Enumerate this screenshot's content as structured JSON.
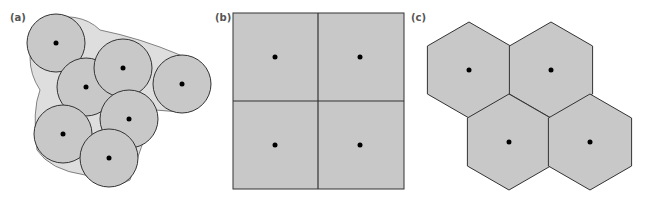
{
  "panels": [
    {
      "id": "a",
      "label": "(a)",
      "label_pos": [
        10,
        21
      ],
      "shape": "circle",
      "radius": 29,
      "cells": [
        {
          "cx": 56,
          "cy": 43
        },
        {
          "cx": 86,
          "cy": 87
        },
        {
          "cx": 123,
          "cy": 68
        },
        {
          "cx": 182,
          "cy": 84
        },
        {
          "cx": 129,
          "cy": 119
        },
        {
          "cx": 63,
          "cy": 134
        },
        {
          "cx": 109,
          "cy": 158
        }
      ]
    },
    {
      "id": "b",
      "label": "(b)",
      "label_pos": [
        215,
        21
      ],
      "shape": "square",
      "bounds": {
        "x": 233,
        "y": 13,
        "w": 171,
        "h": 176
      },
      "divider": {
        "x": 318,
        "y": 101
      },
      "dots": [
        {
          "cx": 275,
          "cy": 57
        },
        {
          "cx": 360,
          "cy": 57
        },
        {
          "cx": 275,
          "cy": 145
        },
        {
          "cx": 360,
          "cy": 145
        }
      ]
    },
    {
      "id": "c",
      "label": "(c)",
      "label_pos": [
        411,
        21
      ],
      "shape": "hexagon",
      "radius": 48,
      "cells": [
        {
          "cx": 469,
          "cy": 70
        },
        {
          "cx": 551,
          "cy": 70
        },
        {
          "cx": 509,
          "cy": 142
        },
        {
          "cx": 590,
          "cy": 142
        }
      ]
    }
  ],
  "colors": {
    "cell_fill": "#c8c8c8",
    "hull_fill": "#dedede",
    "stroke": "#333333",
    "dot": "#000000",
    "label": "#555555"
  }
}
